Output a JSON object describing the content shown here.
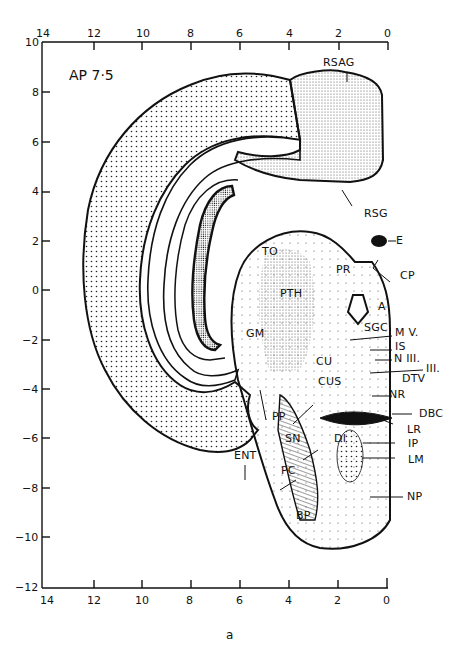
{
  "figure": {
    "section_label": "AP 7·5",
    "caption": "a"
  },
  "axes": {
    "x_ticks": [
      "14",
      "12",
      "10",
      "8",
      "6",
      "4",
      "2",
      "0"
    ],
    "y_ticks": [
      "10",
      "8",
      "6",
      "4",
      "2",
      "0",
      "−2",
      "−4",
      "−6",
      "−8",
      "−10",
      "−12"
    ],
    "x_range": [
      14,
      0
    ],
    "y_range": [
      10,
      -12
    ]
  },
  "labels": {
    "rsag": "RSAG",
    "rsg": "RSG",
    "e": "E",
    "to": "TO",
    "pr": "PR",
    "cp": "CP",
    "pth": "PTH",
    "a": "A",
    "gm": "GM",
    "sgc": "SGC",
    "mv": "M V.",
    "is": "IS",
    "n3": "N III.",
    "iii": "III.",
    "cu": "CU",
    "cus": "CUS",
    "dtv": "DTV",
    "nr": "NR",
    "dbc": "DBC",
    "lr": "LR",
    "pp": "PP",
    "sn": "SN",
    "ent": "ENT",
    "di": "DI",
    "ip": "IP",
    "lm": "LM",
    "pc": "PC",
    "np": "NP",
    "bp": "BP"
  }
}
